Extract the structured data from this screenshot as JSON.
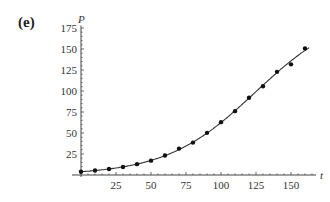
{
  "panel_label": "(e)",
  "chart_data": {
    "type": "scatter",
    "title": "",
    "xlabel": "t",
    "ylabel": "P",
    "xlim": [
      0,
      165
    ],
    "ylim": [
      0,
      180
    ],
    "x_ticks": [
      25,
      50,
      75,
      100,
      125,
      150
    ],
    "y_ticks": [
      25,
      50,
      75,
      100,
      125,
      150,
      175
    ],
    "grid": false,
    "series": [
      {
        "name": "data",
        "kind": "points",
        "x": [
          0,
          10,
          20,
          30,
          40,
          50,
          60,
          70,
          80,
          90,
          100,
          110,
          120,
          130,
          140,
          150,
          160
        ],
        "y": [
          3.9,
          5.3,
          7.2,
          9.6,
          12.9,
          17.1,
          23.2,
          31.4,
          38.6,
          50.2,
          62.9,
          76.0,
          92.0,
          105.7,
          122.8,
          131.7,
          150.7
        ]
      },
      {
        "name": "model",
        "kind": "line",
        "x": [
          0,
          10,
          20,
          30,
          40,
          50,
          60,
          70,
          80,
          90,
          100,
          110,
          120,
          130,
          140,
          150,
          163
        ],
        "y": [
          3.9,
          5.5,
          7.8,
          10.9,
          15.2,
          20.9,
          28.3,
          37.8,
          49.4,
          63.0,
          78.1,
          94.0,
          109.8,
          124.6,
          137.8,
          149.0,
          171.0
        ]
      }
    ]
  }
}
